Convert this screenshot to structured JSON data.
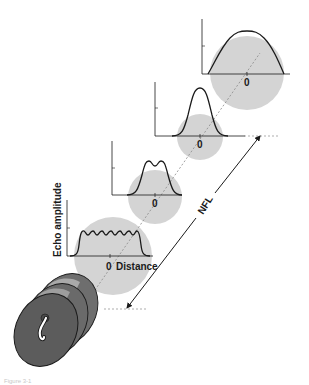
{
  "figure": {
    "y_axis_label": "Echo amplitude",
    "x_axis_label": "Distance",
    "zero_label": "0",
    "nfl_label": "NFL",
    "caption": "Figure 3-1",
    "colors": {
      "beam_circle": "#d4d4d4",
      "line": "#1a1a1a",
      "dashed": "#8a8a8a",
      "transducer_body": "#6e6e6e",
      "transducer_face": "#5c5c5c",
      "transducer_highlight": "#b8b8b8"
    }
  },
  "profiles": [
    {
      "name": "near-zone-multi-peak",
      "zero": "0",
      "distance": "Distance"
    },
    {
      "name": "double-peak",
      "zero": "0"
    },
    {
      "name": "single-peak-at-nfl",
      "zero": "0"
    },
    {
      "name": "far-field-broad",
      "zero": "0"
    }
  ]
}
